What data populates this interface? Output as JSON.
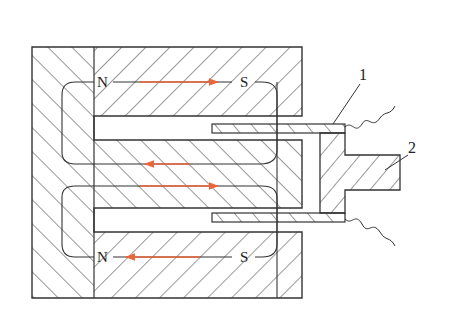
{
  "figure": {
    "type": "magnetic-circuit-cross-section",
    "colors": {
      "outline": "#333333",
      "hatch": "#444444",
      "flux_arrow": "#e8663c",
      "background": "#ffffff"
    },
    "pole_labels": {
      "top_left": "N",
      "top_right": "S",
      "bottom_left": "N",
      "bottom_right": "S"
    },
    "part_labels": {
      "coil_plate": "1",
      "armature": "2"
    },
    "flux_arrows": [
      {
        "position": "top",
        "direction": "right"
      },
      {
        "position": "middle-upper",
        "direction": "left"
      },
      {
        "position": "middle-lower",
        "direction": "right"
      },
      {
        "position": "bottom",
        "direction": "left"
      }
    ],
    "caption": ""
  }
}
